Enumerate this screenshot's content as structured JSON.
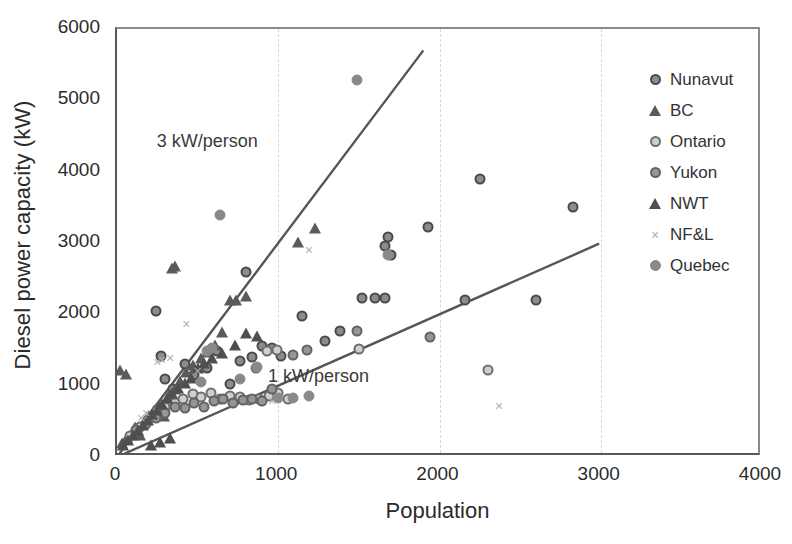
{
  "chart_data": {
    "type": "scatter",
    "title": "",
    "xlabel": "Population",
    "ylabel": "Diesel power capacity (kW)",
    "xlim": [
      0,
      4000
    ],
    "ylim": [
      0,
      6000
    ],
    "xticks": [
      0,
      1000,
      2000,
      3000,
      4000
    ],
    "yticks": [
      0,
      1000,
      2000,
      3000,
      4000,
      5000,
      6000
    ],
    "grid": "vertical-dashed",
    "legend_position": "inside-top-right",
    "annotations": [
      {
        "text": "3 kW/person",
        "x": 560,
        "y": 4430
      },
      {
        "text": "1 kW/person",
        "x": 1250,
        "y": 1130
      }
    ],
    "reference_lines": [
      {
        "name": "3 kW/person",
        "slope": 3,
        "x_from": 0,
        "x_to": 1900,
        "y_from": 0,
        "y_to": 5700
      },
      {
        "name": "1 kW/person",
        "slope": 1,
        "x_from": 0,
        "x_to": 2990,
        "y_from": 0,
        "y_to": 2990
      }
    ],
    "series": [
      {
        "name": "Nunavut",
        "marker": "circle-dark-ring",
        "points": [
          [
            240,
            2050
          ],
          [
            270,
            1420
          ],
          [
            300,
            1100
          ],
          [
            350,
            950
          ],
          [
            420,
            1300
          ],
          [
            480,
            1150
          ],
          [
            560,
            1250
          ],
          [
            620,
            1480
          ],
          [
            700,
            1020
          ],
          [
            760,
            1350
          ],
          [
            840,
            1400
          ],
          [
            900,
            1560
          ],
          [
            960,
            1530
          ],
          [
            1020,
            1420
          ],
          [
            1150,
            1980
          ],
          [
            1290,
            1620
          ],
          [
            1380,
            1760
          ],
          [
            1520,
            2230
          ],
          [
            1600,
            2230
          ],
          [
            1660,
            2230
          ],
          [
            1680,
            3090
          ],
          [
            1700,
            2830
          ],
          [
            1930,
            3220
          ],
          [
            2160,
            2200
          ],
          [
            2250,
            3900
          ],
          [
            2600,
            2200
          ],
          [
            2830,
            3500
          ],
          [
            800,
            2600
          ],
          [
            1660,
            2960
          ]
        ]
      },
      {
        "name": "BC",
        "marker": "triangle",
        "points": [
          [
            30,
            180
          ],
          [
            60,
            260
          ],
          [
            90,
            320
          ],
          [
            110,
            400
          ],
          [
            140,
            300
          ],
          [
            170,
            480
          ],
          [
            200,
            560
          ],
          [
            230,
            640
          ],
          [
            260,
            720
          ],
          [
            290,
            560
          ],
          [
            320,
            860
          ],
          [
            360,
            940
          ],
          [
            390,
            1050
          ],
          [
            430,
            1180
          ],
          [
            470,
            1280
          ],
          [
            520,
            1380
          ],
          [
            560,
            1460
          ],
          [
            610,
            1560
          ],
          [
            650,
            1740
          ],
          [
            700,
            2180
          ],
          [
            740,
            2180
          ],
          [
            800,
            2250
          ],
          [
            1120,
            3000
          ],
          [
            1230,
            3200
          ],
          [
            340,
            2640
          ],
          [
            360,
            2660
          ],
          [
            20,
            1200
          ],
          [
            55,
            1150
          ]
        ]
      },
      {
        "name": "Ontario",
        "marker": "circle-light",
        "points": [
          [
            80,
            300
          ],
          [
            140,
            420
          ],
          [
            190,
            520
          ],
          [
            250,
            640
          ],
          [
            300,
            700
          ],
          [
            360,
            760
          ],
          [
            410,
            820
          ],
          [
            470,
            880
          ],
          [
            520,
            840
          ],
          [
            580,
            900
          ],
          [
            640,
            820
          ],
          [
            700,
            860
          ],
          [
            760,
            840
          ],
          [
            820,
            800
          ],
          [
            880,
            820
          ],
          [
            940,
            860
          ],
          [
            1000,
            900
          ],
          [
            1060,
            820
          ],
          [
            1500,
            1520
          ],
          [
            2300,
            1220
          ],
          [
            860,
            1250
          ],
          [
            930,
            1480
          ],
          [
            990,
            1500
          ]
        ]
      },
      {
        "name": "Yukon",
        "marker": "circle-grey",
        "points": [
          [
            120,
            380
          ],
          [
            180,
            460
          ],
          [
            240,
            540
          ],
          [
            300,
            620
          ],
          [
            360,
            700
          ],
          [
            420,
            680
          ],
          [
            480,
            760
          ],
          [
            540,
            700
          ],
          [
            600,
            780
          ],
          [
            660,
            820
          ],
          [
            720,
            760
          ],
          [
            780,
            800
          ],
          [
            840,
            820
          ],
          [
            900,
            780
          ],
          [
            960,
            960
          ],
          [
            1090,
            1430
          ],
          [
            1180,
            1500
          ],
          [
            1490,
            1760
          ],
          [
            1940,
            1680
          ]
        ]
      },
      {
        "name": "NWT",
        "marker": "triangle",
        "points": [
          [
            40,
            150
          ],
          [
            70,
            230
          ],
          [
            100,
            290
          ],
          [
            130,
            370
          ],
          [
            160,
            430
          ],
          [
            190,
            510
          ],
          [
            220,
            590
          ],
          [
            250,
            650
          ],
          [
            280,
            730
          ],
          [
            310,
            810
          ],
          [
            340,
            880
          ],
          [
            380,
            960
          ],
          [
            420,
            1020
          ],
          [
            460,
            1100
          ],
          [
            500,
            1240
          ],
          [
            540,
            1300
          ],
          [
            590,
            1380
          ],
          [
            650,
            1450
          ],
          [
            730,
            1550
          ],
          [
            800,
            1720
          ],
          [
            870,
            1680
          ],
          [
            210,
            150
          ],
          [
            265,
            200
          ],
          [
            330,
            250
          ]
        ]
      },
      {
        "name": "NF&L",
        "marker": "cross",
        "points": [
          [
            250,
            1330
          ],
          [
            280,
            1360
          ],
          [
            330,
            1390
          ],
          [
            430,
            1860
          ],
          [
            500,
            1200
          ],
          [
            1190,
            2900
          ],
          [
            960,
            790
          ],
          [
            2370,
            720
          ],
          [
            180,
            620
          ],
          [
            150,
            540
          ]
        ]
      },
      {
        "name": "Quebec",
        "marker": "circle-filled",
        "points": [
          [
            640,
            3390
          ],
          [
            590,
            1530
          ],
          [
            560,
            1480
          ],
          [
            520,
            1050
          ],
          [
            760,
            1100
          ],
          [
            1680,
            2830
          ],
          [
            1490,
            5290
          ],
          [
            870,
            1260
          ],
          [
            1000,
            830
          ],
          [
            1090,
            830
          ],
          [
            1190,
            860
          ]
        ]
      }
    ]
  },
  "axis": {
    "y_title": "Diesel power capacity (kW)",
    "x_title": "Population",
    "y_tick_labels": [
      "6000",
      "5000",
      "4000",
      "3000",
      "2000",
      "1000",
      "0"
    ],
    "x_tick_labels": [
      "0",
      "1000",
      "2000",
      "3000",
      "4000"
    ]
  },
  "legend": {
    "items": [
      {
        "label": "Nunavut",
        "marker": "circle-dark-ring",
        "cls": "m-nunavut"
      },
      {
        "label": "BC",
        "marker": "triangle",
        "cls": "m-bc"
      },
      {
        "label": "Ontario",
        "marker": "circle-light",
        "cls": "m-ontario"
      },
      {
        "label": "Yukon",
        "marker": "circle-grey",
        "cls": "m-yukon"
      },
      {
        "label": "NWT",
        "marker": "triangle",
        "cls": "m-nwt"
      },
      {
        "label": "NF&L",
        "marker": "cross",
        "cls": "m-nfl"
      },
      {
        "label": "Quebec",
        "marker": "circle-filled",
        "cls": "m-quebec"
      }
    ]
  },
  "annotations": {
    "three_kw": "3 kW/person",
    "one_kw": "1 kW/person"
  },
  "colors": {
    "line": "#565656",
    "axis": "#585858",
    "grid": "#d8d8d8",
    "text": "#2b2b2b"
  }
}
